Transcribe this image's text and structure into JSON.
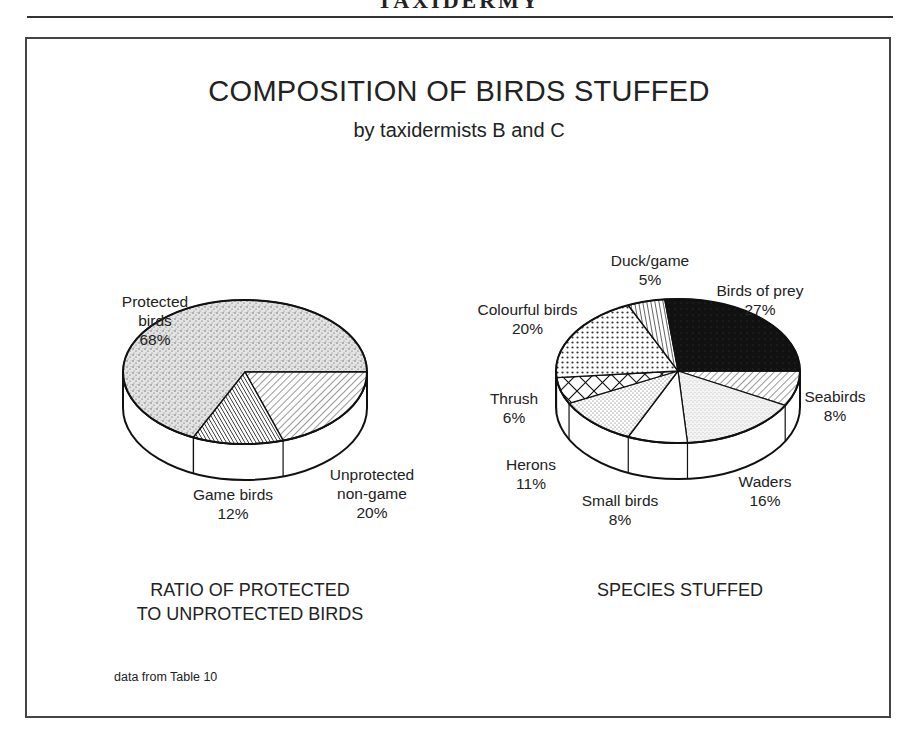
{
  "page_header": "TAXIDERMY",
  "title": "COMPOSITION OF BIRDS STUFFED",
  "subtitle": "by taxidermists B and C",
  "left_chart": {
    "caption_line1": "RATIO OF PROTECTED",
    "caption_line2": "TO UNPROTECTED BIRDS",
    "slices": [
      {
        "name_line1": "Protected",
        "name_line2": "birds",
        "value": "68%"
      },
      {
        "name_line1": "Game birds",
        "name_line2": "",
        "value": "12%"
      },
      {
        "name_line1": "Unprotected",
        "name_line2": "non-game",
        "value": "20%"
      }
    ]
  },
  "right_chart": {
    "caption": "SPECIES STUFFED",
    "slices": [
      {
        "name": "Birds of prey",
        "value": "27%"
      },
      {
        "name": "Seabirds",
        "value": "8%"
      },
      {
        "name": "Waders",
        "value": "16%"
      },
      {
        "name": "Small birds",
        "value": "8%"
      },
      {
        "name": "Herons",
        "value": "11%"
      },
      {
        "name": "Thrush",
        "value": "6%"
      },
      {
        "name": "Colourful birds",
        "value": "20%"
      },
      {
        "name": "Duck/game",
        "value": "5%"
      }
    ]
  },
  "source_note": "data from Table 10",
  "chart_data": [
    {
      "type": "pie",
      "title": "RATIO OF PROTECTED TO UNPROTECTED BIRDS",
      "style": "3d",
      "categories": [
        "Protected birds",
        "Game birds",
        "Unprotected non-game"
      ],
      "values": [
        68,
        12,
        20
      ],
      "unit": "%"
    },
    {
      "type": "pie",
      "title": "SPECIES STUFFED",
      "style": "3d",
      "categories": [
        "Birds of prey",
        "Seabirds",
        "Waders",
        "Small birds",
        "Herons",
        "Thrush",
        "Colourful birds",
        "Duck/game"
      ],
      "values": [
        27,
        8,
        16,
        8,
        11,
        6,
        20,
        5
      ],
      "unit": "%"
    }
  ]
}
